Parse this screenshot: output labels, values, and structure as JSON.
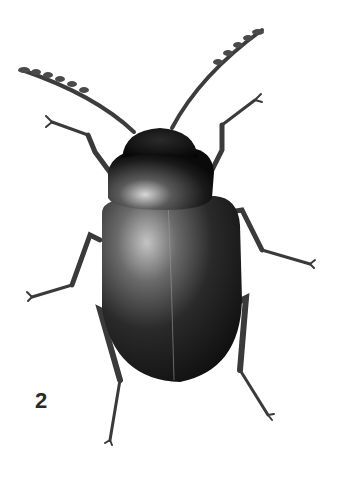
{
  "image": {
    "subject": "beetle illustration (dorsal view)",
    "background_color": "#ffffff",
    "body_colors": {
      "dark": "#111111",
      "mid": "#3a3a3a",
      "highlight": "#b8b8b8"
    }
  },
  "figure": {
    "label": "2"
  }
}
